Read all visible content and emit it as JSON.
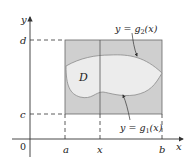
{
  "diagram": {
    "type": "type-I/II region between curves",
    "axes": {
      "x_label": "x",
      "y_label": "y",
      "origin_label": "0"
    },
    "x_ticks": [
      {
        "label": "a",
        "px": 65
      },
      {
        "label": "x",
        "px": 100
      },
      {
        "label": "b",
        "px": 162
      }
    ],
    "y_ticks": [
      {
        "label": "d",
        "py": 40
      },
      {
        "label": "c",
        "py": 114
      }
    ],
    "region": {
      "label": "D",
      "fill": "#ececec",
      "outline": "#8a8a8a"
    },
    "rectangle": {
      "fill": "#cfcfcf",
      "stroke": "#555555"
    },
    "curves": [
      {
        "name": "upper",
        "label_prefix": "y = ",
        "label_func": "g",
        "label_sub": "2",
        "label_arg": "(x)"
      },
      {
        "name": "lower",
        "label_prefix": "y = ",
        "label_func": "g",
        "label_sub": "1",
        "label_arg": "(x)"
      }
    ],
    "colors": {
      "axis": "#333333",
      "text": "#222222",
      "dash": "#333333"
    }
  }
}
